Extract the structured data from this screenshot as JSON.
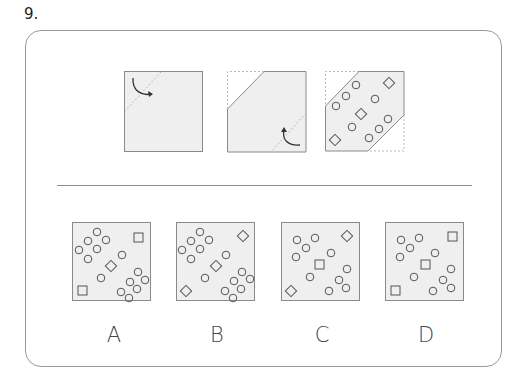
{
  "question": {
    "number_label": "9."
  },
  "colors": {
    "panel_fill": "#efefef",
    "panel_stroke": "#8a8a8a",
    "dashed_stroke": "#b8b8b8",
    "arrow": "#333333",
    "frame": "#9a9a9a"
  },
  "steps": [
    {
      "name": "fold-step-1",
      "description": "square with dashed fold line at top-left corner and arrow folding corner"
    },
    {
      "name": "fold-step-2",
      "description": "top-left corner folded; dashed fold line at bottom-right with arrow"
    },
    {
      "name": "fold-step-3",
      "description": "hexagon with both corners folded; holes punched: circles and diamonds"
    }
  ],
  "options": [
    {
      "label": "A",
      "corner_shape": "square",
      "center_shape": "diamond"
    },
    {
      "label": "B",
      "corner_shape": "diamond",
      "center_shape": "diamond"
    },
    {
      "label": "C",
      "corner_shape": "diamond",
      "center_shape": "square"
    },
    {
      "label": "D",
      "corner_shape": "square",
      "center_shape": "square"
    }
  ]
}
